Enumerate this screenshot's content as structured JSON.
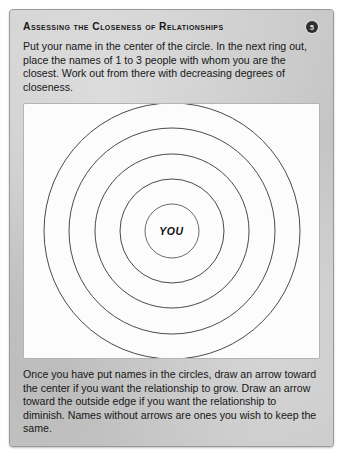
{
  "card": {
    "background_color": "#c6c6c6",
    "border_color": "#9a9a9a"
  },
  "header": {
    "title": "Assessing the Closeness of Relationships",
    "page_badge": "5",
    "badge_icon": "numbered-circle-badge-icon"
  },
  "intro": {
    "text": "Put your name in the center of the circle. In the next ring out, place the names of 1 to 3 people with whom you are the closest. Work out from there with decreasing degrees of closeness."
  },
  "diagram": {
    "name": "concentric-relationship-circles",
    "center_label": "YOU",
    "background_color": "#fcfcfc",
    "stroke_color": "#4a4a4a",
    "ring_count": 5,
    "ring_radii": [
      27,
      52,
      77,
      103,
      128
    ],
    "view_size": 264,
    "center": [
      132,
      132
    ]
  },
  "closing": {
    "text": "Once you have put names in the circles, draw an arrow toward the center if you want the relationship to grow. Draw an arrow toward the outside edge if you want the relationship to diminish. Names without arrows are ones you wish to keep the same."
  }
}
